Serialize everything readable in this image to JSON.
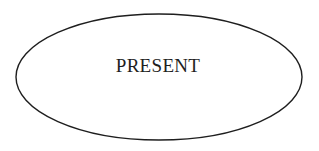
{
  "diagram": {
    "nodes": [
      {
        "id": "present",
        "shape": "ellipse",
        "label": "PRESENT",
        "stroke_color": "#1e1e1e",
        "fill_color": "#ffffff"
      }
    ]
  }
}
